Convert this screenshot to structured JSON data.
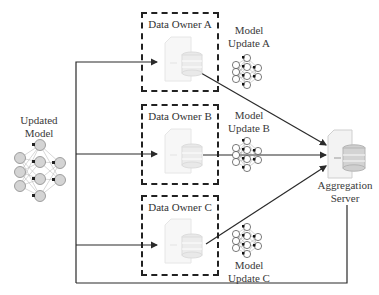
{
  "diagram": {
    "type": "federated-learning-flow",
    "data_owners": [
      {
        "id": "A",
        "label": "Data Owner A",
        "update_label_line1": "Model",
        "update_label_line2": "Update A"
      },
      {
        "id": "B",
        "label": "Data Owner B",
        "update_label_line1": "Model",
        "update_label_line2": "Update B"
      },
      {
        "id": "C",
        "label": "Data Owner C",
        "update_label_line1": "Model",
        "update_label_line2": "Update C"
      }
    ],
    "updated_model": {
      "line1": "Updated",
      "line2": "Model"
    },
    "server": {
      "line1": "Aggregation",
      "line2": "Server"
    },
    "colors": {
      "line": "#2a2a2a",
      "node_fill": "#d9d9d9",
      "node_stroke": "#8a8a8a",
      "icon_faded": "#e6e6e6",
      "dash": "#222222"
    }
  }
}
